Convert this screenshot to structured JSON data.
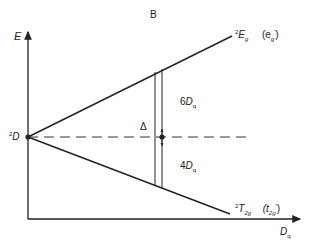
{
  "title": "B",
  "axes": {
    "y_label": "E",
    "x_label_main": "D",
    "x_label_sub": "q"
  },
  "levels": {
    "origin": {
      "sup": "2",
      "main": "D"
    },
    "upper": {
      "sup": "2",
      "main": "E",
      "sub": "g",
      "orbital": "(e",
      "orbital_sub": "g",
      "orbital_sup": "'",
      "orbital_close": ")"
    },
    "lower": {
      "sup": "2",
      "main": "T",
      "sub": "2g",
      "orbital": "(t",
      "orbital_sub": "2g",
      "orbital_sup": "'",
      "orbital_close": ")"
    }
  },
  "annotations": {
    "delta": "Δ",
    "upper_split": {
      "coef": "6",
      "main": "D",
      "sub": "q"
    },
    "lower_split": {
      "coef": "4",
      "main": "D",
      "sub": "q"
    }
  },
  "colors": {
    "line": "#222222",
    "background": "#ffffff"
  }
}
